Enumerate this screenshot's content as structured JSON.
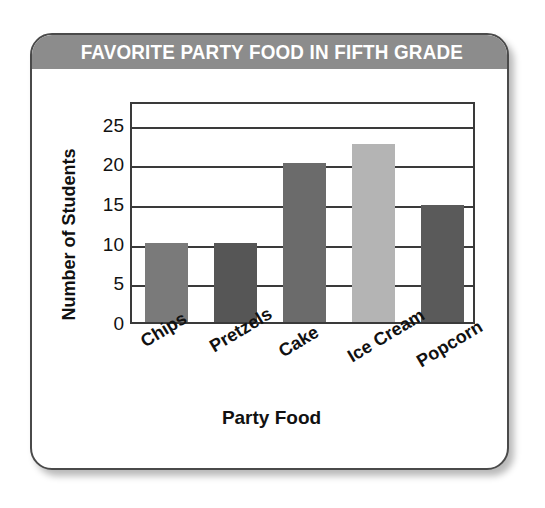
{
  "chart_data": {
    "type": "bar",
    "title": "FAVORITE PARTY FOOD IN FIFTH GRADE",
    "xlabel": "Party Food",
    "ylabel": "Number of Students",
    "categories": [
      "Chips",
      "Pretzels",
      "Cake",
      "Ice Cream",
      "Popcorn"
    ],
    "values": [
      10,
      10,
      20,
      22.5,
      14.7
    ],
    "ylim": [
      0,
      28
    ],
    "yticks": [
      0,
      5,
      10,
      15,
      20,
      25
    ],
    "ytick_labels": [
      "0",
      "5",
      "10",
      "15",
      "20",
      "25"
    ],
    "grid": "horizontal",
    "legend": "none",
    "bar_colors": [
      "#7a7a7a",
      "#565656",
      "#6b6b6b",
      "#b4b4b4",
      "#5a5a5a"
    ]
  },
  "banner": {
    "background_color": "#8c8c8c",
    "text_color": "#ffffff"
  },
  "card": {
    "border_color": "#4a4a4a",
    "background_color": "#ffffff"
  }
}
